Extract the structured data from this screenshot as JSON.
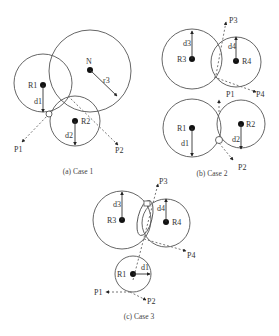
{
  "figure": {
    "case1": {
      "caption": "(a) Case 1",
      "labels": {
        "N": "N",
        "r3": "r3",
        "R1": "R1",
        "R2": "R2",
        "d1": "d1",
        "d2": "d2",
        "P1": "P1",
        "P2": "P2"
      }
    },
    "case2": {
      "caption": "(b) Case 2",
      "labels": {
        "R3": "R3",
        "R4": "R4",
        "d3": "d3",
        "d4": "d4",
        "P3": "P3",
        "P4": "P4",
        "R1": "R1",
        "R2": "R2",
        "d1": "d1",
        "d2": "d2",
        "P1": "P1",
        "P2": "P2"
      }
    },
    "case3": {
      "caption": "(c) Case 3",
      "labels": {
        "R3": "R3",
        "R4": "R4",
        "d3": "d3",
        "d4": "d4",
        "P3": "P3",
        "P4": "P4",
        "R1": "R1",
        "d1": "d1",
        "P1": "P1",
        "P2": "P2"
      }
    }
  }
}
